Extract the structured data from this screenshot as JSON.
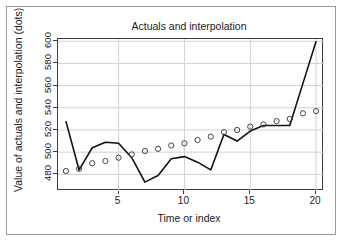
{
  "figure": {
    "title": "Actuals and interpolation",
    "xlabel": "Time or index",
    "ylabel": "Value of actuals and interpolation (dots)"
  },
  "axes": {
    "ytick_labels": [
      "480",
      "500",
      "520",
      "540",
      "560",
      "580",
      "600"
    ],
    "xtick_labels": [
      "5",
      "10",
      "15",
      "20"
    ]
  },
  "colors": {
    "line": "#111111",
    "marker_stroke": "#444444",
    "grid": "#d0d0d0",
    "axis": "#3c3c3c",
    "frame": "#9a9a9a",
    "background": "#ffffff"
  },
  "chart_data": {
    "type": "line",
    "title": "Actuals and interpolation",
    "xlabel": "Time or index",
    "ylabel": "Value of actuals and interpolation (dots)",
    "xlim": [
      0.4,
      20.6
    ],
    "ylim": [
      465,
      602
    ],
    "xticks": [
      5,
      10,
      15,
      20
    ],
    "yticks": [
      480,
      500,
      520,
      540,
      560,
      580,
      600
    ],
    "grid": true,
    "legend": null,
    "x": [
      1,
      2,
      3,
      4,
      5,
      6,
      7,
      8,
      9,
      10,
      11,
      12,
      13,
      14,
      15,
      16,
      17,
      18,
      19,
      20
    ],
    "series": [
      {
        "name": "Actuals",
        "style": "markers",
        "marker": "open-circle",
        "values": [
          483,
          485,
          490,
          492,
          495,
          498,
          501,
          503,
          506,
          508,
          511,
          514,
          518,
          520,
          523,
          525,
          528,
          530,
          535,
          537
        ]
      },
      {
        "name": "Interpolation",
        "style": "line",
        "values": [
          528,
          484,
          504,
          509,
          508,
          495,
          473,
          479,
          494,
          496,
          491,
          484,
          516,
          510,
          519,
          524,
          524,
          524,
          562,
          600
        ]
      }
    ]
  }
}
